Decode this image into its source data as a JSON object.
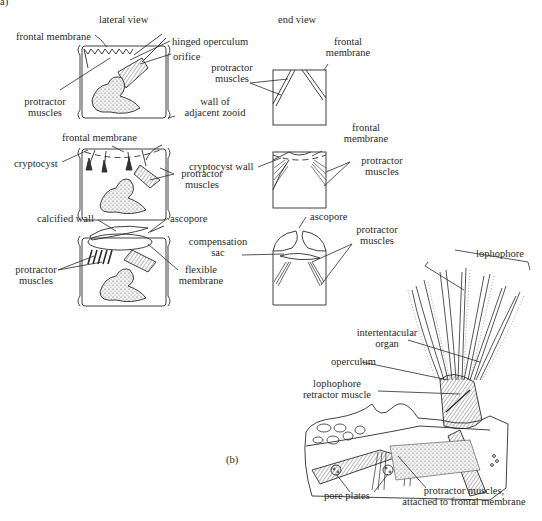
{
  "figure": {
    "panel_a_label": "a)",
    "panel_b_label": "(b)",
    "column_headers": {
      "lateral": "lateral view",
      "end": "end view"
    },
    "row1": {
      "lateral": {
        "frontal_membrane": "frontal membrane",
        "hinged_operculum": "hinged operculum",
        "orifice": "orifice",
        "protractor_muscles_1": "protractor",
        "protractor_muscles_2": "muscles",
        "wall_1": "wall of",
        "wall_2": "adjacent zooid"
      },
      "end": {
        "protractor_1": "protractor",
        "protractor_2": "muscles",
        "frontal_1": "frontal",
        "frontal_2": "membrane"
      }
    },
    "row2": {
      "lateral": {
        "frontal_membrane": "frontal membrane",
        "cryptocyst": "cryptocyst",
        "protractor_1": "protractor",
        "protractor_2": "muscles"
      },
      "end": {
        "frontal_1": "frontal",
        "frontal_2": "membrane",
        "cryptocyst_wall": "cryptocyst wall",
        "protractor_1": "protractor",
        "protractor_2": "muscles"
      }
    },
    "row3": {
      "lateral": {
        "calcified_wall": "calcified wall",
        "ascopore": "ascopore",
        "protractor_1": "protractor",
        "protractor_2": "muscles",
        "flexible_1": "flexible",
        "flexible_2": "membrane"
      },
      "end": {
        "ascopore": "ascopore",
        "compensation_1": "compensation",
        "compensation_2": "sac",
        "protractor_1": "protractor",
        "protractor_2": "muscles"
      }
    },
    "panel_b": {
      "lophophore": "lophophore",
      "intertentacular_1": "intertentacular",
      "intertentacular_2": "organ",
      "operculum": "operculum",
      "retractor_1": "lophophore",
      "retractor_2": "retractor muscle",
      "pore_plates": "pore plates",
      "protractor_1": "protractor muscles,",
      "protractor_2": "attached to frontal membrane"
    }
  }
}
